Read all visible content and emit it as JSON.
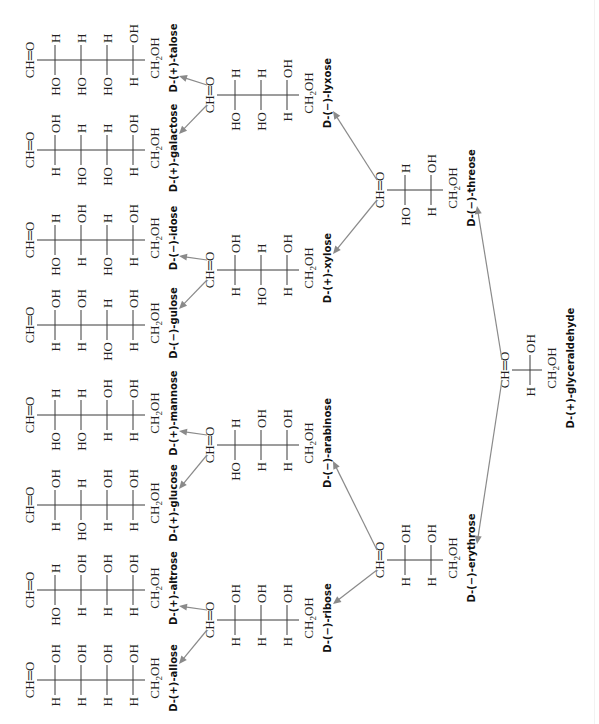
{
  "diagram": {
    "type": "fischer-projection-family-tree",
    "orientation": "rotated 90 degrees counter-clockwise",
    "top_group": "CH=O",
    "bottom_group": "CH2OH",
    "root": {
      "id": "glyceraldehyde",
      "name": "D-(+)-glyceraldehyde",
      "centers": [
        [
          "H",
          "OH"
        ]
      ]
    },
    "tetroses": [
      {
        "id": "erythrose",
        "name": "D-(−)-erythrose",
        "centers": [
          [
            "H",
            "OH"
          ],
          [
            "H",
            "OH"
          ]
        ]
      },
      {
        "id": "threose",
        "name": "D-(−)-threose",
        "centers": [
          [
            "HO",
            "H"
          ],
          [
            "H",
            "OH"
          ]
        ]
      }
    ],
    "pentoses": [
      {
        "id": "ribose",
        "parent": "erythrose",
        "name": "D-(−)-ribose",
        "centers": [
          [
            "H",
            "OH"
          ],
          [
            "H",
            "OH"
          ],
          [
            "H",
            "OH"
          ]
        ]
      },
      {
        "id": "arabinose",
        "parent": "erythrose",
        "name": "D-(−)-arabinose",
        "centers": [
          [
            "HO",
            "H"
          ],
          [
            "H",
            "OH"
          ],
          [
            "H",
            "OH"
          ]
        ]
      },
      {
        "id": "xylose",
        "parent": "threose",
        "name": "D-(+)-xylose",
        "centers": [
          [
            "H",
            "OH"
          ],
          [
            "HO",
            "H"
          ],
          [
            "H",
            "OH"
          ]
        ]
      },
      {
        "id": "lyxose",
        "parent": "threose",
        "name": "D-(−)-lyxose",
        "centers": [
          [
            "HO",
            "H"
          ],
          [
            "HO",
            "H"
          ],
          [
            "H",
            "OH"
          ]
        ]
      }
    ],
    "hexoses": [
      {
        "id": "allose",
        "parent": "ribose",
        "name": "D-(+)-allose",
        "centers": [
          [
            "H",
            "OH"
          ],
          [
            "H",
            "OH"
          ],
          [
            "H",
            "OH"
          ],
          [
            "H",
            "OH"
          ]
        ]
      },
      {
        "id": "altrose",
        "parent": "ribose",
        "name": "D-(+)-altrose",
        "centers": [
          [
            "HO",
            "H"
          ],
          [
            "H",
            "OH"
          ],
          [
            "H",
            "OH"
          ],
          [
            "H",
            "OH"
          ]
        ]
      },
      {
        "id": "glucose",
        "parent": "arabinose",
        "name": "D-(+)-glucose",
        "centers": [
          [
            "H",
            "OH"
          ],
          [
            "HO",
            "H"
          ],
          [
            "H",
            "OH"
          ],
          [
            "H",
            "OH"
          ]
        ]
      },
      {
        "id": "mannose",
        "parent": "arabinose",
        "name": "D-(+)-mannose",
        "centers": [
          [
            "HO",
            "H"
          ],
          [
            "HO",
            "H"
          ],
          [
            "H",
            "OH"
          ],
          [
            "H",
            "OH"
          ]
        ]
      },
      {
        "id": "gulose",
        "parent": "xylose",
        "name": "D-(−)-gulose",
        "centers": [
          [
            "H",
            "OH"
          ],
          [
            "H",
            "OH"
          ],
          [
            "HO",
            "H"
          ],
          [
            "H",
            "OH"
          ]
        ]
      },
      {
        "id": "idose",
        "parent": "xylose",
        "name": "D-(−)-idose",
        "centers": [
          [
            "HO",
            "H"
          ],
          [
            "H",
            "OH"
          ],
          [
            "HO",
            "H"
          ],
          [
            "H",
            "OH"
          ]
        ]
      },
      {
        "id": "galactose",
        "parent": "lyxose",
        "name": "D-(+)-galactose",
        "centers": [
          [
            "H",
            "OH"
          ],
          [
            "HO",
            "H"
          ],
          [
            "HO",
            "H"
          ],
          [
            "H",
            "OH"
          ]
        ]
      },
      {
        "id": "talose",
        "parent": "lyxose",
        "name": "D-(+)-talose",
        "centers": [
          [
            "HO",
            "H"
          ],
          [
            "HO",
            "H"
          ],
          [
            "HO",
            "H"
          ],
          [
            "H",
            "OH"
          ]
        ]
      }
    ]
  },
  "colors": {
    "text": "#231f20",
    "bond": "#3a3a3a",
    "arrow": "#8a8a8a",
    "background": "#ffffff"
  }
}
